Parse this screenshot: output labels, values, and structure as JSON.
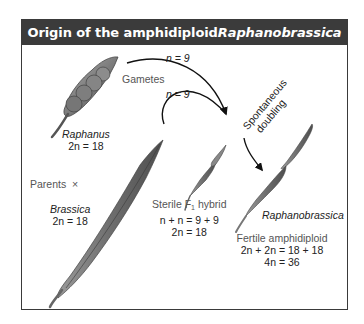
{
  "title": {
    "prefix": "Origin of the amphidiploid ",
    "species": "Raphanobrassica"
  },
  "labels": {
    "gamete_top": "n = 9",
    "gametes": "Gametes",
    "gamete_bottom": "n = 9",
    "spontaneous_line1": "Spontaneous",
    "spontaneous_line2": "doubling",
    "parents": "Parents",
    "cross_symbol": "×"
  },
  "organisms": {
    "raphanus": {
      "name": "Raphanus",
      "ploidy": "2n = 18"
    },
    "brassica": {
      "name": "Brassica",
      "ploidy": "2n = 18"
    },
    "hybrid": {
      "title_prefix": "Sterile F",
      "title_sub": "1",
      "title_suffix": " hybrid",
      "formula": "n + n = 9 + 9",
      "ploidy": "2n = 18"
    },
    "raphanobrassica": {
      "name": "Raphanobrassica",
      "title": "Fertile amphidiploid",
      "formula": "2n + 2n = 18 + 18",
      "ploidy": "4n = 36"
    }
  },
  "colors": {
    "header_bg": "#3b3b3b",
    "pod_fill": "#8a8a8a",
    "pod_dark": "#5a5a5a",
    "border": "#3a3a3a"
  }
}
